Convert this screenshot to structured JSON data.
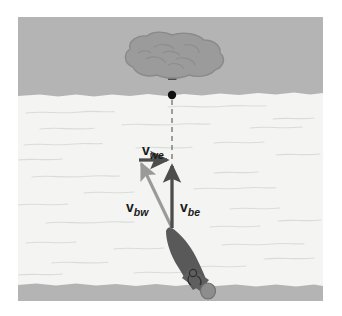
{
  "figure": {
    "canvas": {
      "width": 305,
      "height": 284,
      "offset_x": 18,
      "offset_y": 17
    },
    "colors": {
      "shore": "#b4b4b4",
      "water": "#f4f4f2",
      "water_line": "#d8dcd8",
      "vector_dark": "#4d4d4d",
      "vector_light": "#9a9a9a",
      "boat": "#595959",
      "tree": "#999999",
      "dot": "#111111",
      "page_background": "#ffffff"
    },
    "regions": [
      {
        "name": "far-shore",
        "label": "far shore",
        "y_top": 0,
        "y_bottom": 79
      },
      {
        "name": "river-water",
        "label": "river water",
        "y_top": 79,
        "y_bottom": 267
      },
      {
        "name": "near-shore",
        "label": "near shore",
        "y_top": 267,
        "y_bottom": 284
      }
    ],
    "vectors": [
      {
        "name": "v-be",
        "label_main": "v",
        "label_sub": "be",
        "meaning": "velocity of boat relative to earth",
        "style": "solid-dark",
        "x1": 154,
        "y1": 211,
        "x2": 154,
        "y2": 143,
        "label_x": 161,
        "label_y": 191
      },
      {
        "name": "v-we",
        "label_main": "v",
        "label_sub": "we",
        "meaning": "velocity of water relative to earth",
        "style": "solid-dark",
        "x1": 121,
        "y1": 143,
        "x2": 154,
        "y2": 143,
        "label_x": 124,
        "label_y": 133
      },
      {
        "name": "v-bw",
        "label_main": "v",
        "label_sub": "bw",
        "meaning": "velocity of boat relative to water",
        "style": "solid-light",
        "x1": 154,
        "y1": 211,
        "x2": 121,
        "y2": 143,
        "label_x": 111,
        "label_y": 191
      }
    ],
    "reference_line": {
      "name": "sight-line",
      "label": "dashed line of sight to tree",
      "style": "dashed",
      "x1": 154,
      "y1": 78,
      "x2": 154,
      "y2": 143
    },
    "markers": [
      {
        "name": "reference-dot",
        "label": "target point on far shore",
        "cx": 154,
        "cy": 78,
        "r": 4.2
      }
    ],
    "objects": [
      {
        "name": "tree",
        "label": "tree on far shore",
        "cx": 154,
        "cy": 42
      },
      {
        "name": "boat",
        "label": "motorboat with outboard motor",
        "bow_x": 154,
        "bow_y": 211
      }
    ]
  }
}
